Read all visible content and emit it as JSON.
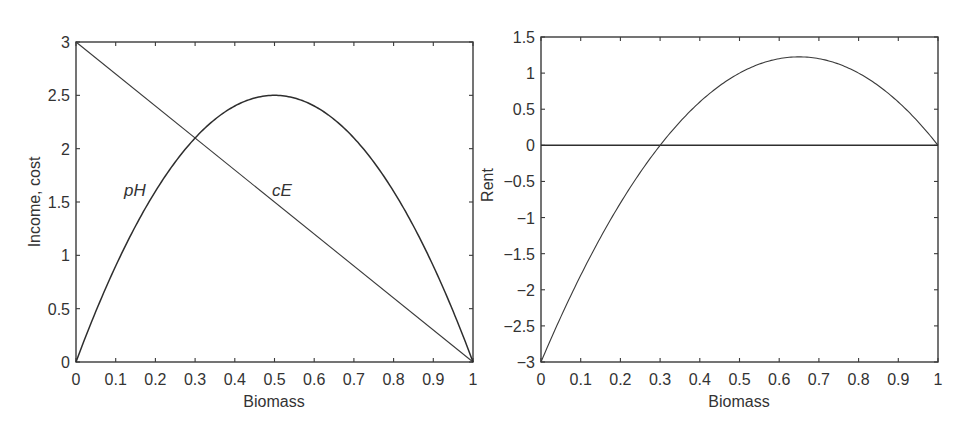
{
  "chart_data": [
    {
      "type": "line",
      "title": "",
      "xlabel": "Biomass",
      "ylabel": "Income, cost",
      "xlim": [
        0,
        1
      ],
      "ylim": [
        0,
        3
      ],
      "grid": false,
      "legend": "none (inline annotations)",
      "x_ticks": [
        "0",
        "0.1",
        "0.2",
        "0.3",
        "0.4",
        "0.5",
        "0.6",
        "0.7",
        "0.8",
        "0.9",
        "1"
      ],
      "y_ticks": [
        "0",
        "0.5",
        "1",
        "1.5",
        "2",
        "2.5",
        "3"
      ],
      "series": [
        {
          "name": "pH",
          "formula": "10*x*(1-x)",
          "x": [
            0,
            0.1,
            0.2,
            0.3,
            0.4,
            0.5,
            0.6,
            0.7,
            0.8,
            0.9,
            1
          ],
          "values": [
            0,
            0.9,
            1.6,
            2.1,
            2.4,
            2.5,
            2.4,
            2.1,
            1.6,
            0.9,
            0
          ]
        },
        {
          "name": "cE",
          "formula": "3*(1-x)",
          "x": [
            0,
            0.1,
            0.2,
            0.3,
            0.4,
            0.5,
            0.6,
            0.7,
            0.8,
            0.9,
            1
          ],
          "values": [
            3,
            2.7,
            2.4,
            2.1,
            1.8,
            1.5,
            1.2,
            0.9,
            0.6,
            0.3,
            0
          ]
        }
      ],
      "annotations": [
        {
          "text": "pH",
          "x": 0.12,
          "y": 1.55
        },
        {
          "text": "cE",
          "x": 0.5,
          "y": 1.55
        }
      ]
    },
    {
      "type": "line",
      "title": "",
      "xlabel": "Biomass",
      "ylabel": "Rent",
      "xlim": [
        0,
        1
      ],
      "ylim": [
        -3,
        1.5
      ],
      "grid": false,
      "x_ticks": [
        "0",
        "0.1",
        "0.2",
        "0.3",
        "0.4",
        "0.5",
        "0.6",
        "0.7",
        "0.8",
        "0.9",
        "1"
      ],
      "y_ticks": [
        "−3",
        "−2.5",
        "−2",
        "−1.5",
        "−1",
        "−0.5",
        "0",
        "0.5",
        "1",
        "1.5"
      ],
      "series": [
        {
          "name": "Rent",
          "formula": "(1-x)*(10*x-3)",
          "x": [
            0,
            0.1,
            0.2,
            0.3,
            0.4,
            0.5,
            0.6,
            0.65,
            0.7,
            0.8,
            0.9,
            1
          ],
          "values": [
            -3,
            -1.8,
            -0.8,
            0,
            0.6,
            1.0,
            1.2,
            1.225,
            1.2,
            1.0,
            0.6,
            0
          ]
        },
        {
          "name": "zero line",
          "x": [
            0,
            1
          ],
          "values": [
            0,
            0
          ]
        }
      ]
    }
  ]
}
